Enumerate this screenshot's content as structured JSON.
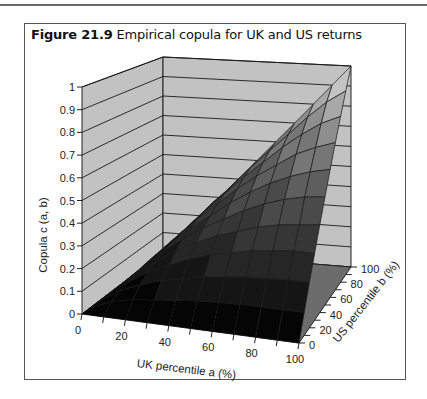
{
  "figure": {
    "label": "Figure 21.9",
    "title": "Empirical copula for UK and US returns"
  },
  "chart_data": {
    "type": "surface3d",
    "title": "Empirical copula for UK and US returns",
    "xlabel": "UK percentile a (%)",
    "ylabel": "US percentile b (%)",
    "zlabel": "Copula c (a, b)",
    "x_ticks": [
      0,
      20,
      40,
      60,
      80,
      100
    ],
    "y_ticks": [
      0,
      20,
      40,
      60,
      80,
      100
    ],
    "z_ticks": [
      "0",
      "0.1",
      "0.2",
      "0.3",
      "0.4",
      "0.5",
      "0.6",
      "0.7",
      "0.8",
      "0.9",
      "1"
    ],
    "x": [
      0,
      10,
      20,
      30,
      40,
      50,
      60,
      70,
      80,
      90,
      100
    ],
    "y": [
      0,
      10,
      20,
      30,
      40,
      50,
      60,
      70,
      80,
      90,
      100
    ],
    "zlim": [
      0,
      1
    ],
    "z": [
      [
        0,
        0,
        0,
        0,
        0,
        0,
        0,
        0,
        0,
        0,
        0
      ],
      [
        0,
        0.04,
        0.06,
        0.07,
        0.08,
        0.09,
        0.095,
        0.098,
        0.1,
        0.1,
        0.1
      ],
      [
        0,
        0.06,
        0.1,
        0.13,
        0.15,
        0.17,
        0.18,
        0.19,
        0.195,
        0.2,
        0.2
      ],
      [
        0,
        0.07,
        0.13,
        0.17,
        0.21,
        0.24,
        0.26,
        0.28,
        0.29,
        0.3,
        0.3
      ],
      [
        0,
        0.08,
        0.15,
        0.21,
        0.26,
        0.3,
        0.33,
        0.36,
        0.38,
        0.39,
        0.4
      ],
      [
        0,
        0.09,
        0.17,
        0.24,
        0.3,
        0.35,
        0.4,
        0.44,
        0.47,
        0.49,
        0.5
      ],
      [
        0,
        0.095,
        0.18,
        0.26,
        0.33,
        0.4,
        0.46,
        0.51,
        0.55,
        0.58,
        0.6
      ],
      [
        0,
        0.098,
        0.19,
        0.28,
        0.36,
        0.44,
        0.51,
        0.57,
        0.63,
        0.67,
        0.7
      ],
      [
        0,
        0.1,
        0.195,
        0.29,
        0.38,
        0.47,
        0.55,
        0.63,
        0.7,
        0.76,
        0.8
      ],
      [
        0,
        0.1,
        0.2,
        0.3,
        0.39,
        0.49,
        0.58,
        0.67,
        0.76,
        0.84,
        0.9
      ],
      [
        0,
        0.1,
        0.2,
        0.3,
        0.4,
        0.5,
        0.6,
        0.7,
        0.8,
        0.9,
        1
      ]
    ],
    "grid": true,
    "band_colors": [
      "#050505",
      "#151515",
      "#262626",
      "#363636",
      "#4a4a4a",
      "#5e5e5e",
      "#767676",
      "#8e8e8e",
      "#a8a8a8",
      "#c4c4c4",
      "#e6e6e6"
    ],
    "wall_color": "#c2c2c2",
    "floor_color": "#0a0a0a"
  }
}
